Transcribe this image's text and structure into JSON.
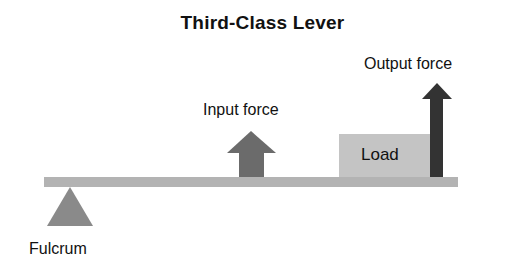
{
  "title": "Third-Class Lever",
  "labels": {
    "input_force": "Input force",
    "output_force": "Output force",
    "load": "Load",
    "fulcrum": "Fulcrum"
  },
  "colors": {
    "bar": "#b3b3b3",
    "fulcrum": "#8a8a8a",
    "load_box": "#c4c4c4",
    "input_arrow": "#6b6b6b",
    "output_arrow": "#333333",
    "text": "#111111"
  }
}
